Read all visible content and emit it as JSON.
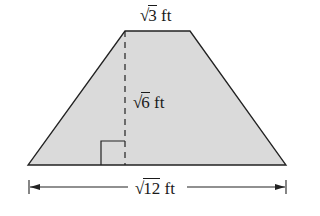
{
  "figure": {
    "shape": "trapezoid",
    "fill_color": "#d9d9d9",
    "stroke_color": "#222222",
    "top_base": {
      "radicand": "3",
      "unit": "ft"
    },
    "height": {
      "radicand": "6",
      "unit": "ft"
    },
    "bottom_base": {
      "radicand": "12",
      "unit": "ft"
    },
    "right_angle_marker": true
  },
  "labels": {
    "sqrt_symbol": "√",
    "top_radicand": "3",
    "top_unit": " ft",
    "height_radicand": "6",
    "height_unit": " ft",
    "bottom_radicand": "12",
    "bottom_unit": " ft"
  }
}
